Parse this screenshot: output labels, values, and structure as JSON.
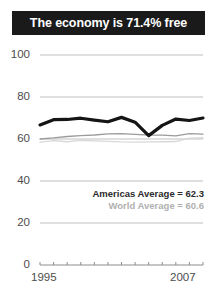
{
  "title": {
    "text": "The economy is 71.4% free"
  },
  "legend": [
    {
      "label": "Americas Average = 62.3",
      "color": "#2b2b2b"
    },
    {
      "label": "World Average = 60.6",
      "color": "#b0b0b0"
    }
  ],
  "axis": {
    "y_ticks": [
      "100",
      "80",
      "60",
      "40",
      "20",
      "0"
    ],
    "x_start": "1995",
    "x_end": "2007"
  },
  "colors": {
    "title_background": "#1a1a1a",
    "title_text": "#ffffff",
    "gridline": "#bfbfbf",
    "country_line": "#151515",
    "americas_line": "#9b9b9b",
    "world_line": "#d8d8d8",
    "tick_text": "#4d4d4d"
  },
  "chart_data": {
    "type": "line",
    "title": "The economy is 71.4% free",
    "xlabel": "",
    "ylabel": "",
    "ylim": [
      0,
      100
    ],
    "xlim": [
      1995,
      2007
    ],
    "yticks": [
      0,
      20,
      40,
      60,
      80,
      100
    ],
    "grid": true,
    "legend_position": "inside-right",
    "x": [
      1995,
      1996,
      1997,
      1998,
      1999,
      2000,
      2001,
      2002,
      2003,
      2004,
      2005,
      2006,
      2007
    ],
    "series": [
      {
        "name": "Country",
        "color": "#151515",
        "width": 3.2,
        "values": [
          66.7,
          69.2,
          69.3,
          69.9,
          69.0,
          68.2,
          70.3,
          68.0,
          61.6,
          66.5,
          69.5,
          68.8,
          70.0
        ]
      },
      {
        "name": "Americas Average",
        "color": "#9b9b9b",
        "width": 1.3,
        "values": [
          60.0,
          60.5,
          61.2,
          61.6,
          61.9,
          62.4,
          62.6,
          62.2,
          61.9,
          61.8,
          61.5,
          62.6,
          62.3
        ]
      },
      {
        "name": "World Average",
        "color": "#d8d8d8",
        "width": 1.3,
        "values": [
          58.5,
          59.2,
          58.7,
          59.3,
          59.1,
          58.9,
          58.6,
          58.5,
          58.6,
          58.7,
          58.8,
          60.4,
          60.6
        ]
      }
    ],
    "annotations": [
      {
        "text": "Americas Average = 62.3",
        "value": 62.3
      },
      {
        "text": "World Average = 60.6",
        "value": 60.6
      }
    ]
  }
}
